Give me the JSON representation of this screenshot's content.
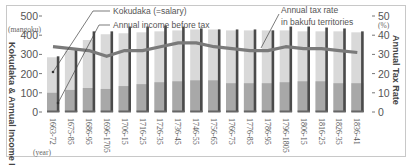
{
  "chart_data": {
    "type": "bar",
    "title": "",
    "xlabel": "(year)",
    "ylabel": "Kokudaka & Annual Income Before Tax",
    "ylabel_unit": "(mangoku)",
    "y2label": "Annual Tax Rate",
    "y2label_unit": "(%)",
    "ylim": [
      0,
      500
    ],
    "y2lim": [
      0,
      50
    ],
    "yticks": [
      0,
      100,
      200,
      300,
      400,
      500
    ],
    "y2ticks": [
      0,
      10,
      20,
      30,
      40,
      50
    ],
    "grid": false,
    "categories": [
      "1663-72",
      "1675-85",
      "1686-95",
      "1696-1705",
      "1706-15",
      "1716-25",
      "1726-35",
      "1736-45",
      "1746-55",
      "1756-65",
      "1766-75",
      "1776-85",
      "1786-95",
      "1796-1805",
      "1806-15",
      "1816-25",
      "1826-35",
      "1836-41"
    ],
    "series": [
      {
        "name": "Kokudaka (=salary)",
        "kind": "bar",
        "axis": "left",
        "color": "#d9d9d9",
        "values": [
          285,
          320,
          375,
          405,
          410,
          415,
          420,
          425,
          430,
          430,
          425,
          425,
          425,
          425,
          420,
          420,
          420,
          415
        ]
      },
      {
        "name": "Annual income before tax",
        "kind": "bar",
        "axis": "left",
        "color": "#a8a8a8",
        "values": [
          100,
          115,
          125,
          120,
          135,
          145,
          155,
          160,
          165,
          165,
          150,
          150,
          150,
          155,
          160,
          160,
          150,
          150
        ]
      },
      {
        "name": "Salary marker",
        "kind": "line-marker",
        "axis": "left",
        "color": "#4a4a4a",
        "values": [
          290,
          330,
          420,
          420,
          445,
          445,
          450,
          445,
          435,
          430,
          430,
          430,
          425,
          445,
          445,
          440,
          435,
          420
        ]
      },
      {
        "name": "Annual tax rate in bakufu territories",
        "kind": "line",
        "axis": "right",
        "color": "#7a7a7a",
        "values": [
          34,
          33,
          32,
          29,
          32,
          32,
          34,
          36,
          36,
          34,
          33,
          32,
          32,
          34,
          33,
          33,
          32,
          31
        ]
      }
    ],
    "annotations": [
      "Kokudaka (=salary)",
      "Annual income before tax",
      "Annual tax rate in bakufu territories"
    ]
  },
  "labels": {
    "legend_kokudaka": "Kokudaka (=salary)",
    "legend_income": "Annual income before tax",
    "legend_tax_line1": "Annual tax rate",
    "legend_tax_line2": "in bakufu territories",
    "y_unit": "(mangoku)",
    "y2_unit": "(%)",
    "x_unit": "(year)",
    "y_title": "Kokudaka & Annual Income Before Tax",
    "y2_title": "Annual Tax Rate"
  }
}
